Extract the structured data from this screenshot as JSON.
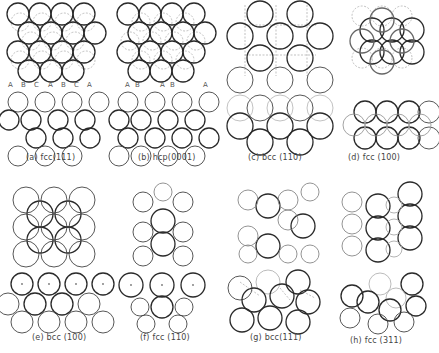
{
  "figure": {
    "panels": [
      {
        "id": "a",
        "caption": "(a)  fcc(111)",
        "top_view": "hexagonal close-packed layer with dashed second/third layers",
        "side_view": "ABC stacking"
      },
      {
        "id": "b",
        "caption": "(b) hcp(0001)",
        "top_view": "hexagonal close-packed layer with dashed second layer",
        "side_view": "AB stacking"
      },
      {
        "id": "c",
        "caption": "(c)  bcc (110)",
        "top_view": "centered rectangular",
        "side_view": "bcc (110) profile"
      },
      {
        "id": "d",
        "caption": "(d)  fcc (100)",
        "top_view": "square lattice",
        "side_view": "fcc (100) profile"
      },
      {
        "id": "e",
        "caption": "(e)  bcc (100)",
        "top_view": "square lattice",
        "side_view": "bcc (100) profile"
      },
      {
        "id": "f",
        "caption": "(f)  fcc (110)",
        "top_view": "rectangular rows",
        "side_view": "fcc (110) profile"
      },
      {
        "id": "g",
        "caption": "(g)  bcc(111)",
        "top_view": "open hexagonal",
        "side_view": "bcc (111) profile"
      },
      {
        "id": "h",
        "caption": "(h)  fcc (311)",
        "top_view": "stepped rows",
        "side_view": "fcc (311) profile"
      }
    ],
    "stacking_labels": {
      "a": [
        "A",
        "B",
        "C",
        "A",
        "B",
        "C",
        "A"
      ],
      "b": [
        "A",
        "B",
        "A",
        "B",
        "A"
      ]
    }
  }
}
